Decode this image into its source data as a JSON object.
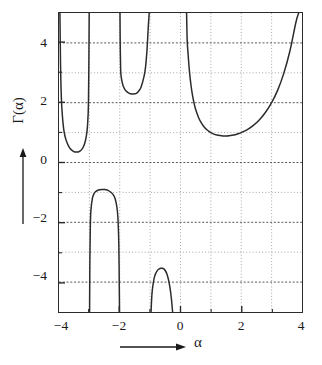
{
  "chart_data": {
    "type": "line",
    "title": "",
    "subtitle": "",
    "xlabel": "α",
    "ylabel": "Γ(α)",
    "xlim": [
      -4,
      4
    ],
    "ylim": [
      -5,
      5
    ],
    "xticks": [
      -4,
      -2,
      0,
      2,
      4
    ],
    "xticklabels": [
      "−4",
      "−2",
      "0",
      "2",
      "4"
    ],
    "yticks": [
      -4,
      -2,
      0,
      2,
      4
    ],
    "yticklabels": [
      "−4",
      "−2",
      "0",
      "2",
      "4"
    ],
    "grid": true,
    "grid_spacing": 1,
    "grid_style": "dotted",
    "legend": null,
    "function": "Gamma(alpha)",
    "asymptotes": [
      -3,
      -2,
      -1,
      0
    ],
    "series": [
      {
        "name": "Γ(α) branch α ∈ (-4,-3)",
        "points": [
          [
            -3.97,
            5.0
          ],
          [
            -3.95,
            3.3
          ],
          [
            -3.93,
            2.4
          ],
          [
            -3.9,
            1.72
          ],
          [
            -3.85,
            1.15
          ],
          [
            -3.8,
            0.87
          ],
          [
            -3.75,
            0.7
          ],
          [
            -3.7,
            0.58
          ],
          [
            -3.65,
            0.49
          ],
          [
            -3.6,
            0.43
          ],
          [
            -3.55,
            0.39
          ],
          [
            -3.5,
            0.36
          ],
          [
            -3.45,
            0.35
          ],
          [
            -3.4,
            0.35
          ],
          [
            -3.35,
            0.36
          ],
          [
            -3.3,
            0.39
          ],
          [
            -3.25,
            0.44
          ],
          [
            -3.2,
            0.52
          ],
          [
            -3.15,
            0.65
          ],
          [
            -3.1,
            0.88
          ],
          [
            -3.06,
            1.25
          ],
          [
            -3.03,
            2.0
          ],
          [
            -3.012,
            4.0
          ],
          [
            -3.006,
            5.0
          ]
        ]
      },
      {
        "name": "Γ(α) branch α ∈ (-3,-2)",
        "points": [
          [
            -2.993,
            -5.0
          ],
          [
            -2.985,
            -3.5
          ],
          [
            -2.97,
            -2.2
          ],
          [
            -2.95,
            -1.6
          ],
          [
            -2.9,
            -1.2
          ],
          [
            -2.85,
            -1.05
          ],
          [
            -2.8,
            -0.98
          ],
          [
            -2.7,
            -0.92
          ],
          [
            -2.6,
            -0.9
          ],
          [
            -2.5,
            -0.905
          ],
          [
            -2.45,
            -0.91
          ],
          [
            -2.4,
            -0.925
          ],
          [
            -2.3,
            -0.985
          ],
          [
            -2.2,
            -1.1
          ],
          [
            -2.15,
            -1.22
          ],
          [
            -2.1,
            -1.45
          ],
          [
            -2.06,
            -1.85
          ],
          [
            -2.03,
            -2.8
          ],
          [
            -2.015,
            -4.2
          ],
          [
            -2.008,
            -5.0
          ]
        ]
      },
      {
        "name": "Γ(α) branch α ∈ (-2,-1)",
        "points": [
          [
            -1.992,
            5.0
          ],
          [
            -1.985,
            4.0
          ],
          [
            -1.97,
            3.1
          ],
          [
            -1.95,
            2.85
          ],
          [
            -1.9,
            2.6
          ],
          [
            -1.85,
            2.48
          ],
          [
            -1.8,
            2.4
          ],
          [
            -1.7,
            2.32
          ],
          [
            -1.6,
            2.29
          ],
          [
            -1.5,
            2.3
          ],
          [
            -1.45,
            2.315
          ],
          [
            -1.4,
            2.36
          ],
          [
            -1.3,
            2.52
          ],
          [
            -1.2,
            2.88
          ],
          [
            -1.15,
            3.2
          ],
          [
            -1.1,
            3.8
          ],
          [
            -1.06,
            4.55
          ],
          [
            -1.03,
            5.0
          ]
        ]
      },
      {
        "name": "Γ(α) branch α ∈ (-1,0)",
        "points": [
          [
            -0.97,
            -5.0
          ],
          [
            -0.94,
            -4.4
          ],
          [
            -0.9,
            -4.05
          ],
          [
            -0.85,
            -3.8
          ],
          [
            -0.8,
            -3.68
          ],
          [
            -0.75,
            -3.6
          ],
          [
            -0.7,
            -3.56
          ],
          [
            -0.65,
            -3.54
          ],
          [
            -0.6,
            -3.54
          ],
          [
            -0.55,
            -3.56
          ],
          [
            -0.5,
            -3.62
          ],
          [
            -0.45,
            -3.72
          ],
          [
            -0.4,
            -3.9
          ],
          [
            -0.35,
            -4.16
          ],
          [
            -0.3,
            -4.55
          ],
          [
            -0.26,
            -5.0
          ]
        ]
      },
      {
        "name": "Γ(α) branch α > 0",
        "points": [
          [
            0.2,
            5.0
          ],
          [
            0.22,
            4.1
          ],
          [
            0.25,
            3.62
          ],
          [
            0.3,
            2.99
          ],
          [
            0.35,
            2.55
          ],
          [
            0.4,
            2.22
          ],
          [
            0.45,
            1.97
          ],
          [
            0.5,
            1.77
          ],
          [
            0.6,
            1.49
          ],
          [
            0.7,
            1.3
          ],
          [
            0.8,
            1.16
          ],
          [
            0.9,
            1.07
          ],
          [
            1.0,
            1.0
          ],
          [
            1.1,
            0.95
          ],
          [
            1.2,
            0.92
          ],
          [
            1.3,
            0.9
          ],
          [
            1.4,
            0.887
          ],
          [
            1.46,
            0.886
          ],
          [
            1.5,
            0.886
          ],
          [
            1.6,
            0.894
          ],
          [
            1.7,
            0.909
          ],
          [
            1.8,
            0.931
          ],
          [
            1.9,
            0.962
          ],
          [
            2.0,
            1.0
          ],
          [
            2.2,
            1.1
          ],
          [
            2.4,
            1.24
          ],
          [
            2.6,
            1.43
          ],
          [
            2.8,
            1.68
          ],
          [
            3.0,
            2.0
          ],
          [
            3.2,
            2.42
          ],
          [
            3.4,
            2.98
          ],
          [
            3.6,
            3.72
          ],
          [
            3.8,
            4.69
          ],
          [
            3.89,
            5.0
          ]
        ]
      }
    ],
    "special_points": {
      "minimum_positive_branch": {
        "x": 1.4616,
        "y": 0.8856
      },
      "local_min_branch_m4_m3": {
        "x": -3.446,
        "y": 0.336
      },
      "local_max_branch_m3_m2": {
        "x": -2.457,
        "y": -0.905
      },
      "local_min_branch_m2_m1": {
        "x": -1.573,
        "y": 2.302
      },
      "local_max_branch_m1_0": {
        "x": -0.6169,
        "y": -3.545
      }
    }
  },
  "figure": {
    "axis_arrow_x": "right-arrow",
    "axis_arrow_y": "up-arrow",
    "curve_color": "#2b2b2b",
    "frame_color": "#2b2b2b",
    "grid_color": "#9a9a9a",
    "background": "#ffffff"
  }
}
